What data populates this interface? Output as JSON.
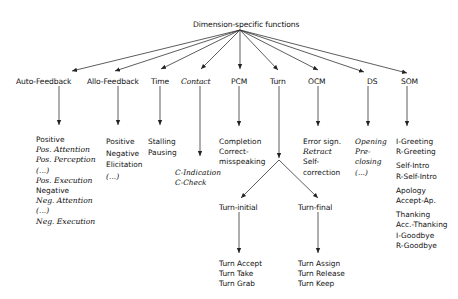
{
  "root": {
    "label": "Dimension-specific functions"
  },
  "dimensions": [
    {
      "id": "auto-feedback",
      "label": "Auto-Feedback",
      "italic": false
    },
    {
      "id": "allo-feedback",
      "label": "Allo-Feedback",
      "italic": false
    },
    {
      "id": "time",
      "label": "Time",
      "italic": false
    },
    {
      "id": "contact",
      "label": "Contact",
      "italic": true
    },
    {
      "id": "pcm",
      "label": "PCM",
      "italic": false
    },
    {
      "id": "turn",
      "label": "Turn",
      "italic": false
    },
    {
      "id": "ocm",
      "label": "OCM",
      "italic": false
    },
    {
      "id": "ds",
      "label": "DS",
      "italic": false
    },
    {
      "id": "som",
      "label": "SOM",
      "italic": false
    }
  ],
  "functions": {
    "auto_feedback": [
      "Positive",
      "Pos. Attention",
      "Pos. Perception",
      "(...)",
      "Pos. Execution",
      "Negative",
      "Neg. Attention",
      "(...)",
      "Neg. Execution"
    ],
    "allo_feedback": [
      "Positive",
      "Negative",
      "Elicitation",
      "(...)"
    ],
    "time": [
      "Stalling",
      "Pausing"
    ],
    "contact": [
      "C-Indication",
      "C-Check"
    ],
    "pcm": [
      "Completion",
      "Correct-",
      "misspeaking"
    ],
    "ocm": [
      "Error sign.",
      "Retract",
      "Self-",
      "correction"
    ],
    "ds": [
      "Opening",
      "Pre-",
      "closing",
      "(...)"
    ],
    "som": [
      "I-Greeting",
      "R-Greeting",
      "Self-Intro",
      "R-Self-Intro",
      "Apology",
      "Accept-Ap.",
      "Thanking",
      "Acc.-Thanking",
      "I-Goodbye",
      "R-Goodbye"
    ]
  },
  "turn": {
    "initial": {
      "label": "Turn-initial",
      "functions": [
        "Turn Accept",
        "Turn Take",
        "Turn Grab"
      ]
    },
    "final": {
      "label": "Turn-final",
      "functions": [
        "Turn Assign",
        "Turn Release",
        "Turn Keep"
      ]
    }
  }
}
